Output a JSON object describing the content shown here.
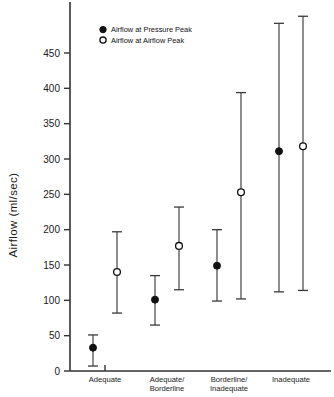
{
  "chart_data": {
    "type": "scatter",
    "title": "",
    "xlabel": "",
    "ylabel": "Airflow (ml/sec)",
    "ylim": [
      0,
      500
    ],
    "yticks": [
      0,
      50,
      100,
      150,
      200,
      250,
      300,
      350,
      400,
      450
    ],
    "ytick_labels": [
      "0",
      "50",
      "100",
      "150",
      "200",
      "250",
      "300",
      "350",
      "400",
      "450"
    ],
    "grid": false,
    "legend_position": "upper-left",
    "categories": [
      "Adequate",
      "Adequate/ Borderline",
      "Borderline/ Inadequate",
      "Inadequate"
    ],
    "category_lines": [
      [
        "Adequate",
        ""
      ],
      [
        "Adequate/",
        "Borderline"
      ],
      [
        "Borderline/",
        "Inadequate"
      ],
      [
        "Inadequate",
        ""
      ]
    ],
    "series": [
      {
        "name": "Airflow at Pressure Peak",
        "marker": "filled-circle",
        "color": "#111111",
        "values": [
          33,
          101,
          149,
          311
        ],
        "lower": [
          7,
          65,
          99,
          112
        ],
        "upper": [
          51,
          135,
          200,
          492
        ]
      },
      {
        "name": "Airflow at Airflow Peak",
        "marker": "open-circle",
        "color": "#111111",
        "values": [
          140,
          177,
          253,
          318
        ],
        "lower": [
          82,
          115,
          102,
          114
        ],
        "upper": [
          197,
          232,
          394,
          502
        ]
      }
    ]
  },
  "legend": {
    "items": [
      {
        "label": "Airflow at Pressure Peak",
        "marker": "filled-circle"
      },
      {
        "label": "Airflow at Airflow Peak",
        "marker": "open-circle"
      }
    ]
  },
  "axis": {
    "y_title": "Airflow (ml/sec)"
  }
}
